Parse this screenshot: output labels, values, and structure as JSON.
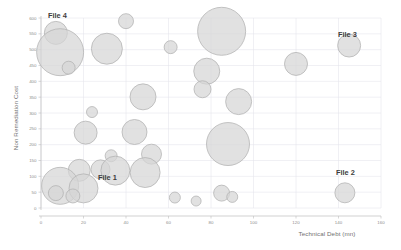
{
  "chart_data": {
    "type": "scatter",
    "title": "",
    "subtitle": "",
    "xlabel": "Technical Debt (mn)",
    "ylabel": "Non Remediation Cost",
    "xlim": [
      0,
      160
    ],
    "ylim": [
      0,
      600
    ],
    "xticks": [
      0,
      20,
      40,
      60,
      80,
      100,
      120,
      140,
      160
    ],
    "yticks": [
      0,
      50,
      100,
      150,
      200,
      250,
      300,
      350,
      400,
      450,
      500,
      550,
      600
    ],
    "grid": true,
    "legend": "none",
    "bubble_fill": "#d6d6d6",
    "bubble_stroke": "#b2b2b2",
    "grid_color": "#e3e3ea",
    "axis_color": "#bdbdbd",
    "points": [
      {
        "x": 7,
        "y": 553,
        "size": 11.5
      },
      {
        "x": 40,
        "y": 590,
        "size": 7.5
      },
      {
        "x": 9,
        "y": 492,
        "size": 23.5
      },
      {
        "x": 31,
        "y": 503,
        "size": 15.5
      },
      {
        "x": 13,
        "y": 443,
        "size": 6.5
      },
      {
        "x": 61,
        "y": 508,
        "size": 6.5
      },
      {
        "x": 85,
        "y": 558,
        "size": 24.0
      },
      {
        "x": 78,
        "y": 432,
        "size": 13.0
      },
      {
        "x": 145,
        "y": 513,
        "size": 11.5
      },
      {
        "x": 48,
        "y": 351,
        "size": 13.0
      },
      {
        "x": 76,
        "y": 375,
        "size": 8.5
      },
      {
        "x": 93,
        "y": 336,
        "size": 13.0
      },
      {
        "x": 120,
        "y": 455,
        "size": 11.5
      },
      {
        "x": 24,
        "y": 303,
        "size": 5.5
      },
      {
        "x": 21,
        "y": 238,
        "size": 11.5
      },
      {
        "x": 44,
        "y": 240,
        "size": 12.5
      },
      {
        "x": 88,
        "y": 202,
        "size": 21.5
      },
      {
        "x": 52,
        "y": 170,
        "size": 10.0
      },
      {
        "x": 33,
        "y": 165,
        "size": 6.0
      },
      {
        "x": 18,
        "y": 119,
        "size": 11.0
      },
      {
        "x": 28,
        "y": 122,
        "size": 9.5
      },
      {
        "x": 35,
        "y": 118,
        "size": 14.5
      },
      {
        "x": 49,
        "y": 112,
        "size": 15.0
      },
      {
        "x": 9,
        "y": 70,
        "size": 18.5
      },
      {
        "x": 20,
        "y": 62,
        "size": 14.5
      },
      {
        "x": 7,
        "y": 47,
        "size": 7.5
      },
      {
        "x": 15,
        "y": 38,
        "size": 7.0
      },
      {
        "x": 63,
        "y": 33,
        "size": 5.5
      },
      {
        "x": 73,
        "y": 22,
        "size": 5.0
      },
      {
        "x": 85,
        "y": 47,
        "size": 8.0
      },
      {
        "x": 90,
        "y": 35,
        "size": 5.5
      },
      {
        "x": 143,
        "y": 48,
        "size": 10.0
      }
    ],
    "annotations": [
      {
        "label": "File 4",
        "x_px": 48,
        "y_px": 18
      },
      {
        "label": "File 3",
        "x_px": 338,
        "y_px": 37
      },
      {
        "label": "File 2",
        "x_px": 336,
        "y_px": 175
      },
      {
        "label": "File 1",
        "x_px": 98,
        "y_px": 180
      }
    ]
  }
}
